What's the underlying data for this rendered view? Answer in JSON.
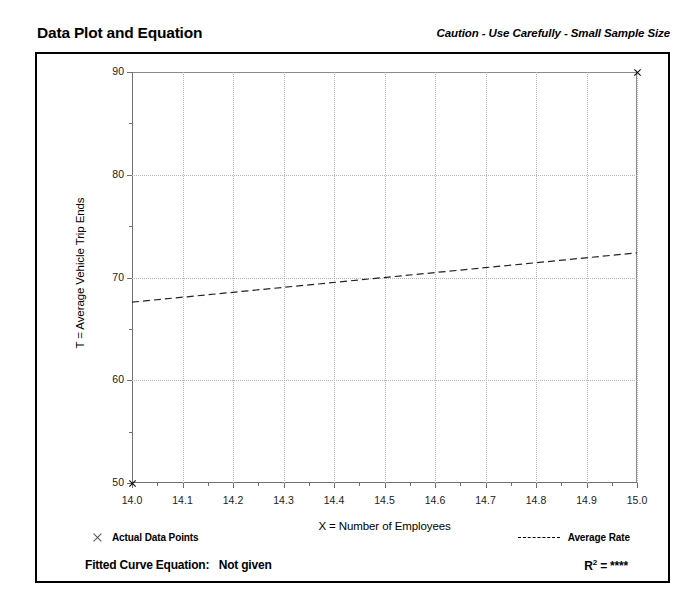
{
  "header": {
    "title": "Data Plot and Equation",
    "caution": "Caution - Use Carefully - Small Sample Size"
  },
  "legend": {
    "data_points_label": "Actual Data Points",
    "average_rate_label": "Average Rate",
    "marker_icon": "x-marker-icon",
    "line_icon": "dashed-line-icon"
  },
  "footer": {
    "equation_label": "Fitted Curve Equation:",
    "equation_value": "Not given",
    "r2_symbol": "R",
    "r2_exponent": "2",
    "r2_equals": "=",
    "r2_value": "****"
  },
  "chart_data": {
    "type": "scatter",
    "title": "Data Plot and Equation",
    "xlabel": "X = Number of Employees",
    "ylabel": "T = Average Vehicle Trip Ends",
    "xlim": [
      14.0,
      15.0
    ],
    "ylim": [
      50,
      90
    ],
    "xticks": [
      "14.0",
      "14.1",
      "14.2",
      "14.3",
      "14.4",
      "14.5",
      "14.6",
      "14.7",
      "14.8",
      "14.9",
      "15.0"
    ],
    "xtick_values": [
      14.0,
      14.1,
      14.2,
      14.3,
      14.4,
      14.5,
      14.6,
      14.7,
      14.8,
      14.9,
      15.0
    ],
    "xminor_step": 0.05,
    "yticks": [
      "50",
      "60",
      "70",
      "80",
      "90"
    ],
    "ytick_values": [
      50,
      60,
      70,
      80,
      90
    ],
    "yminor_step": 5,
    "grid": true,
    "legend_position": "below-plot",
    "series": [
      {
        "name": "Actual Data Points",
        "type": "scatter",
        "marker": "x",
        "points": [
          {
            "x": 14.0,
            "y": 50
          },
          {
            "x": 15.0,
            "y": 90
          }
        ]
      },
      {
        "name": "Average Rate",
        "type": "line",
        "style": "dashed",
        "points": [
          {
            "x": 14.0,
            "y": 67.6
          },
          {
            "x": 15.0,
            "y": 72.4
          }
        ]
      }
    ],
    "annotations": {
      "caution": "Caution - Use Carefully - Small Sample Size",
      "fitted_curve_equation": "Not given",
      "r_squared": "****"
    }
  }
}
